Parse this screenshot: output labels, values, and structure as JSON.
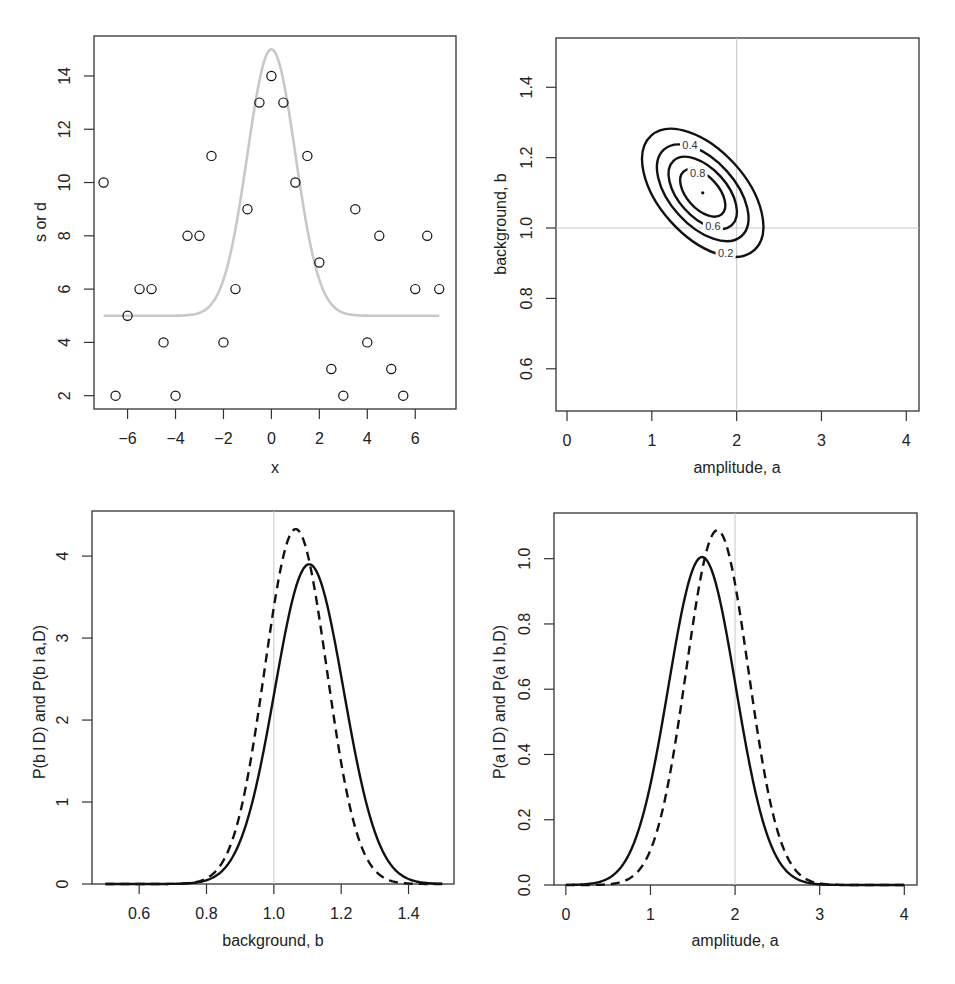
{
  "figure": {
    "background": "#ffffff",
    "colors": {
      "axis": "#333333",
      "data_ink": "#111111",
      "model_curve": "#c8c8c8",
      "reference_line": "#c8c8c8"
    }
  },
  "chart_data": [
    {
      "id": "panel-data-fit",
      "type": "scatter",
      "title": "",
      "xlabel": "x",
      "ylabel": "s or d",
      "xlim": [
        -7.4,
        7.7
      ],
      "ylim": [
        1.5,
        15.5
      ],
      "xticks": [
        -6,
        -4,
        -2,
        0,
        2,
        4,
        6
      ],
      "xtick_labels": [
        "−6",
        "−4",
        "−2",
        "0",
        "2",
        "4",
        "6"
      ],
      "yticks": [
        2,
        4,
        6,
        8,
        10,
        12,
        14
      ],
      "ytick_labels": [
        "2",
        "4",
        "6",
        "8",
        "10",
        "12",
        "14"
      ],
      "grid": false,
      "series": [
        {
          "name": "data d",
          "style": "open-circle",
          "x": [
            -7,
            -6.5,
            -6,
            -5.5,
            -5,
            -4.5,
            -4,
            -3.5,
            -3,
            -2.5,
            -2,
            -1.5,
            -1,
            -0.5,
            0,
            0.5,
            1,
            1.5,
            2,
            2.5,
            3,
            3.5,
            4,
            4.5,
            5,
            5.5,
            6,
            6.5,
            7
          ],
          "y": [
            10,
            2,
            5,
            6,
            6,
            4,
            2,
            8,
            8,
            11,
            4,
            6,
            9,
            13,
            14,
            13,
            10,
            11,
            7,
            3,
            2,
            9,
            4,
            8,
            3,
            2,
            6,
            8,
            6
          ]
        },
        {
          "name": "model s = b + a exp(-x^2/2w^2)",
          "style": "gray-line",
          "function": "gaussian_plus_background",
          "params": {
            "a": 10,
            "b": 5,
            "w": 1.0,
            "x0": 0
          },
          "x_range": [
            -7,
            7
          ]
        }
      ]
    },
    {
      "id": "panel-joint-posterior",
      "type": "contour",
      "title": "",
      "xlabel": "amplitude, a",
      "ylabel": "background, b",
      "xlim": [
        -0.13,
        4.15
      ],
      "ylim": [
        0.48,
        1.54
      ],
      "xticks": [
        0,
        1,
        2,
        3,
        4
      ],
      "xtick_labels": [
        "0",
        "1",
        "2",
        "3",
        "4"
      ],
      "yticks": [
        0.6,
        0.8,
        1.0,
        1.2,
        1.4
      ],
      "ytick_labels": [
        "0.6",
        "0.8",
        "1.0",
        "1.2",
        "1.4"
      ],
      "grid": false,
      "reference_lines": {
        "vertical_a": 2.0,
        "horizontal_b": 1.0
      },
      "mode": {
        "a": 1.6,
        "b": 1.1
      },
      "contour_levels": [
        0.2,
        0.4,
        0.6,
        0.8
      ],
      "contour_labels": [
        {
          "text": "0.4",
          "a": 1.45,
          "b": 1.235
        },
        {
          "text": "0.8",
          "a": 1.54,
          "b": 1.155
        },
        {
          "text": "0.6",
          "a": 1.72,
          "b": 1.005
        },
        {
          "text": "0.2",
          "a": 1.87,
          "b": 0.93
        }
      ]
    },
    {
      "id": "panel-marginal-b",
      "type": "line",
      "title": "",
      "xlabel": "background, b",
      "ylabel": "P(b I D)  and  P(b I a,D)",
      "xlim": [
        0.46,
        1.535
      ],
      "ylim": [
        0,
        4.55
      ],
      "xticks": [
        0.6,
        0.8,
        1.0,
        1.2,
        1.4
      ],
      "xtick_labels": [
        "0.6",
        "0.8",
        "1.0",
        "1.2",
        "1.4"
      ],
      "yticks": [
        0,
        1,
        2,
        3,
        4
      ],
      "ytick_labels": [
        "0",
        "1",
        "2",
        "3",
        "4"
      ],
      "grid": false,
      "reference_lines": {
        "vertical_b": 1.0
      },
      "x_range": [
        0.5,
        1.5
      ],
      "series": [
        {
          "name": "P(b | D) marginal",
          "style": "solid",
          "mean": 1.105,
          "sd": 0.1023,
          "peak": 3.9
        },
        {
          "name": "P(b | a,D) conditional",
          "style": "dashed",
          "mean": 1.065,
          "sd": 0.0921,
          "peak": 4.33
        }
      ]
    },
    {
      "id": "panel-marginal-a",
      "type": "line",
      "title": "",
      "xlabel": "amplitude, a",
      "ylabel": "P(a I D)  and  P(a I b,D)",
      "xlim": [
        -0.14,
        4.15
      ],
      "ylim": [
        0,
        1.14
      ],
      "xticks": [
        0,
        1,
        2,
        3,
        4
      ],
      "xtick_labels": [
        "0",
        "1",
        "2",
        "3",
        "4"
      ],
      "yticks": [
        0.0,
        0.2,
        0.4,
        0.6,
        0.8,
        1.0
      ],
      "ytick_labels": [
        "0.0",
        "0.2",
        "0.4",
        "0.6",
        "0.8",
        "1.0"
      ],
      "grid": false,
      "reference_lines": {
        "vertical_a": 2.0
      },
      "x_range": [
        0,
        4
      ],
      "series": [
        {
          "name": "P(a | D) marginal",
          "style": "solid",
          "mean": 1.61,
          "sd": 0.397,
          "peak": 1.005
        },
        {
          "name": "P(a | b,D) conditional",
          "style": "dashed",
          "mean": 1.79,
          "sd": 0.367,
          "peak": 1.087
        }
      ]
    }
  ]
}
